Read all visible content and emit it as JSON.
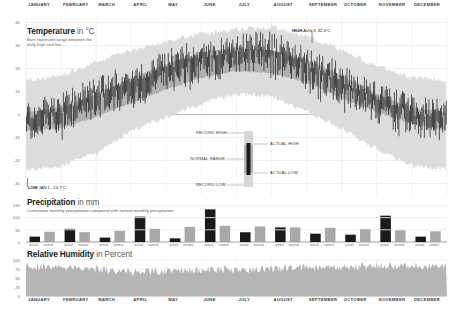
{
  "months": [
    "JANUARY",
    "FEBRUARY",
    "MARCH",
    "APRIL",
    "MAY",
    "JUNE",
    "JULY",
    "AUGUST",
    "SEPTEMBER",
    "OCTOBER",
    "NOVEMBER",
    "DECEMBER"
  ],
  "temperature": {
    "title": "Temperature",
    "title_unit": " in °C",
    "subtitle_line1": "Bars represent range between the",
    "subtitle_line2": "daily high and low.",
    "y_ticks": [
      "40",
      "30",
      "20",
      "10",
      "0",
      "-10",
      "-20",
      "-30"
    ],
    "high_annotation": {
      "tag": "HIGH",
      "text": "AUG 3, 32.4°C"
    },
    "low_annotation": {
      "tag": "LOW",
      "text": "JAN 1, -13.7°C"
    },
    "legend": {
      "record_high": "RECORD HIGH",
      "normal_range": "NORMAL RANGE",
      "record_low": "RECORD LOW",
      "actual_high": "ACTUAL HIGH",
      "actual_low": "ACTUAL LOW"
    }
  },
  "precipitation": {
    "title": "Precipitation",
    "title_unit": " in mm",
    "subtitle": "Cumulative monthly precipitation compared with normal monthly precipitation.",
    "y_ticks": [
      "150",
      "100",
      "50",
      "0"
    ],
    "bar_label_actual": "actual",
    "bar_label_normal": "normal"
  },
  "humidity": {
    "title": "Relative Humidity",
    "title_unit": " in Percent",
    "y_ticks": [
      "100",
      "75",
      "50",
      "25",
      "0"
    ]
  },
  "colors": {
    "record_band": "#d7d7d7",
    "normal_band": "#b3b3b3",
    "actual_bar": "#1a1a1a",
    "precip_actual": "#1a1a1a",
    "precip_normal": "#a8a8a8",
    "humidity_fill": "#b5b5b5",
    "grid": "#d9d9d9"
  },
  "chart_data": {
    "type": "line",
    "panels": [
      {
        "type": "area",
        "name": "Temperature",
        "ylabel": "°C",
        "ylim": [
          -35,
          42
        ],
        "grid": true,
        "categories": [
          "JANUARY",
          "FEBRUARY",
          "MARCH",
          "APRIL",
          "MAY",
          "JUNE",
          "JULY",
          "AUGUST",
          "SEPTEMBER",
          "OCTOBER",
          "NOVEMBER",
          "DECEMBER"
        ],
        "series": [
          {
            "name": "RECORD HIGH",
            "values": [
              15,
              17,
              23,
              28,
              32,
              35,
              37,
              38,
              34,
              28,
              21,
              16
            ]
          },
          {
            "name": "NORMAL HIGH",
            "values": [
              1,
              3,
              9,
              16,
              22,
              27,
              29,
              28,
              24,
              17,
              9,
              3
            ]
          },
          {
            "name": "NORMAL LOW",
            "values": [
              -7,
              -6,
              -1,
              5,
              11,
              16,
              19,
              18,
              14,
              7,
              1,
              -4
            ]
          },
          {
            "name": "RECORD LOW",
            "values": [
              -24,
              -22,
              -17,
              -7,
              -1,
              5,
              9,
              8,
              1,
              -6,
              -15,
              -22
            ]
          },
          {
            "name": "ACTUAL HIGH",
            "values": [
              2,
              5,
              12,
              18,
              24,
              29,
              31,
              32,
              25,
              18,
              11,
              4
            ]
          },
          {
            "name": "ACTUAL LOW",
            "values": [
              -9,
              -5,
              0,
              6,
              12,
              17,
              20,
              19,
              13,
              6,
              0,
              -5
            ]
          }
        ],
        "annotations": [
          {
            "label": "HIGH AUG 3, 32.4°C",
            "x": "AUGUST",
            "y": 32.4
          },
          {
            "label": "LOW JAN 1, -13.7°C",
            "x": "JANUARY",
            "y": -13.7
          }
        ]
      },
      {
        "type": "bar",
        "name": "Precipitation",
        "ylabel": "mm",
        "ylim": [
          0,
          160
        ],
        "categories": [
          "JANUARY",
          "FEBRUARY",
          "MARCH",
          "APRIL",
          "MAY",
          "JUNE",
          "JULY",
          "AUGUST",
          "SEPTEMBER",
          "OCTOBER",
          "NOVEMBER",
          "DECEMBER"
        ],
        "series": [
          {
            "name": "actual",
            "values": [
              22,
              54,
              18,
              104,
              15,
              134,
              40,
              60,
              34,
              30,
              108,
              22
            ]
          },
          {
            "name": "normal",
            "values": [
              42,
              40,
              46,
              54,
              62,
              66,
              64,
              60,
              58,
              52,
              48,
              44
            ]
          }
        ]
      },
      {
        "type": "area",
        "name": "Relative Humidity",
        "ylabel": "Percent",
        "ylim": [
          0,
          100
        ],
        "categories": [
          "JANUARY",
          "FEBRUARY",
          "MARCH",
          "APRIL",
          "MAY",
          "JUNE",
          "JULY",
          "AUGUST",
          "SEPTEMBER",
          "OCTOBER",
          "NOVEMBER",
          "DECEMBER"
        ],
        "series": [
          {
            "name": "Relative Humidity",
            "values": [
              82,
              80,
              74,
              66,
              70,
              72,
              74,
              76,
              78,
              80,
              84,
              86
            ]
          }
        ]
      }
    ]
  }
}
